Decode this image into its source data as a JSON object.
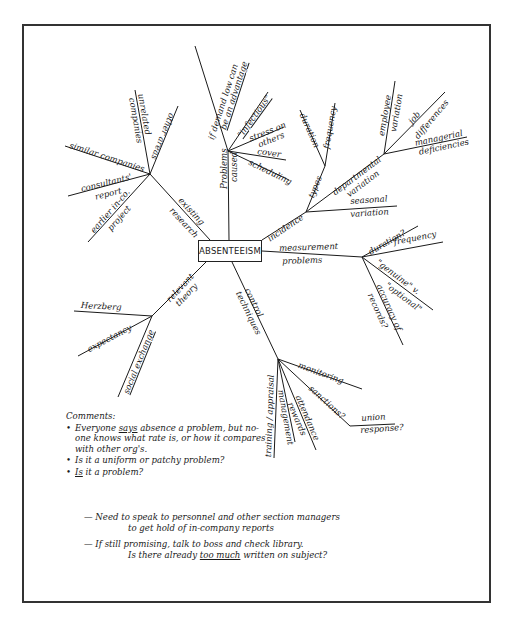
{
  "center_node": {
    "label": "ABSENTEEISM"
  },
  "branches": {
    "existing_research": {
      "label_line1": "existing",
      "label_line2": "research",
      "children": [
        "similar companies",
        "consultants'",
        "report",
        "earlier in-co.",
        "project",
        "unrelated",
        "companies",
        "other areas"
      ]
    },
    "problems_caused": {
      "label_line1": "Problems",
      "label_line2": "caused",
      "children": [
        "if demand low can",
        "be an advantage",
        "\"infectious\"",
        "stress on",
        "others",
        "cover",
        "scheduling"
      ]
    },
    "incidence": {
      "label": "incidence",
      "types": {
        "label": "types",
        "children": [
          "duration",
          "frequency"
        ]
      },
      "departmental": {
        "label_line1": "departmental",
        "label_line2": "variation",
        "children": [
          "employee",
          "variation",
          "job",
          "differences",
          "managerial",
          "deficiencies"
        ]
      },
      "seasonal": {
        "label_line1": "seasonal",
        "label_line2": "variation"
      }
    },
    "measurement_problems": {
      "label_line1": "measurement",
      "label_line2": "problems",
      "children": [
        "duration?",
        "frequency",
        "\"genuine\" v.",
        "\"optional\"",
        "accuracy of",
        "records?"
      ]
    },
    "relevant_theory": {
      "label_line1": "relevant",
      "label_line2": "theory",
      "children": [
        "Herzberg",
        "expectancy",
        "social exchange"
      ]
    },
    "control_techniques": {
      "label_line1": "control",
      "label_line2": "techniques",
      "children": [
        "monitoring",
        "sanctions?",
        "union",
        "response?",
        "attendance",
        "rewards",
        "management",
        "training / appraisal"
      ]
    }
  },
  "comments": {
    "title": "Comments:",
    "items": [
      {
        "pre": "Everyone ",
        "emph": "says",
        "post": " absence a problem, but no-one knows what rate is, or how it compares with other org's."
      },
      {
        "pre": "Is it a uniform or patchy problem?",
        "emph": "",
        "post": ""
      },
      {
        "pre": "",
        "emph": "Is",
        "post": " it a problem?"
      }
    ]
  },
  "notes": [
    {
      "line1": "— Need to speak to personnel and other section managers",
      "line2": "to get hold of in-company reports"
    },
    {
      "line1": "— If still promising, talk to boss and check library.",
      "line2_pre": "Is there already ",
      "line2_emph": "too much",
      "line2_post": " written on subject?"
    }
  ],
  "colors": {
    "ink": "#1a1a1a",
    "frame": "#333333",
    "background": "#ffffff"
  }
}
